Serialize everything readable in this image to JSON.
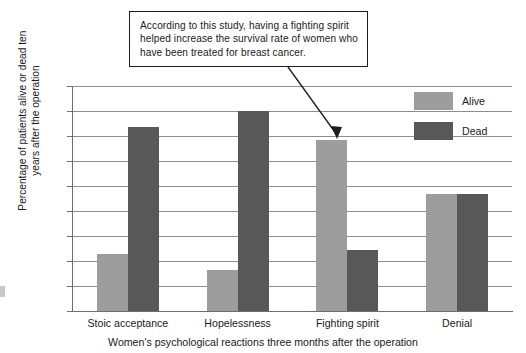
{
  "callout": {
    "text": "According to this study, having a fighting spirit helped increase the survival rate of women who have been treated for breast cancer."
  },
  "legend": {
    "items": [
      {
        "label": "Alive",
        "color": "#9d9d9d"
      },
      {
        "label": "Dead",
        "color": "#585858"
      }
    ]
  },
  "axes": {
    "y_title": "Percentage of patients alive or dead ten years after the operation",
    "x_title": "Women's psychological reactions three months after the operation",
    "y_ticks": [
      "0",
      "10",
      "20",
      "30",
      "40",
      "50",
      "60",
      "70",
      "80",
      "90"
    ]
  },
  "chart_data": {
    "type": "bar",
    "title": "",
    "subtitle": "",
    "categories": [
      "Stoic acceptance",
      "Hopelessness",
      "Fighting spirit",
      "Denial"
    ],
    "series": [
      {
        "name": "Alive",
        "color": "#9d9d9d",
        "values": [
          23,
          16.5,
          68.5,
          47
        ]
      },
      {
        "name": "Dead",
        "color": "#585858",
        "values": [
          73.5,
          80,
          24.5,
          47
        ]
      }
    ],
    "xlabel": "Women's psychological reactions three months after the operation",
    "ylabel": "Percentage of patients alive or dead ten years after the operation",
    "ylim": [
      0,
      90
    ],
    "ytick_step": 10,
    "grid": true,
    "legend_position": "top-right",
    "annotations": [
      {
        "text": "According to this study, having a fighting spirit helped increase the survival rate of women who have been treated for breast cancer.",
        "points_to": {
          "category": "Fighting spirit",
          "series": "Alive"
        }
      }
    ]
  }
}
